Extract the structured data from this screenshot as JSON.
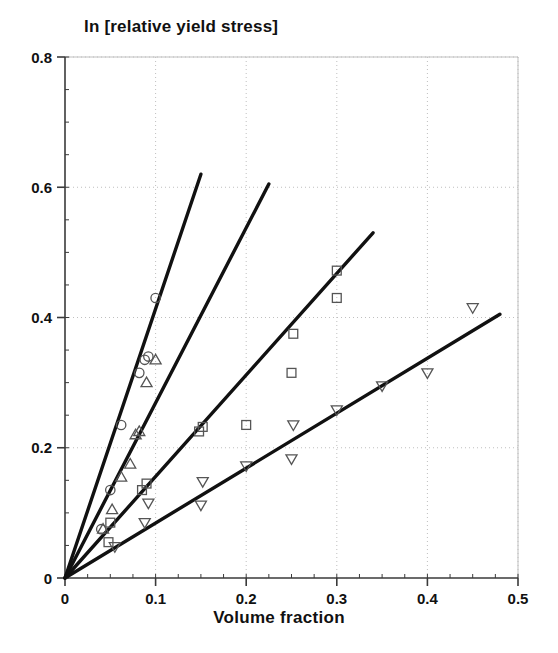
{
  "chart_data": {
    "type": "scatter",
    "title": "ln [relative yield stress]",
    "xlabel": "Volume fraction",
    "ylabel": "",
    "xlim": [
      0,
      0.5
    ],
    "ylim": [
      0,
      0.8
    ],
    "xticks": [
      0,
      0.1,
      0.2,
      0.3,
      0.4,
      0.5
    ],
    "xtick_labels": [
      "0",
      "0.1",
      "0.2",
      "0.3",
      "0.4",
      "0.5"
    ],
    "yticks": [
      0,
      0.2,
      0.4,
      0.6,
      0.8
    ],
    "ytick_labels": [
      "0",
      "0.2",
      "0.4",
      "0.6",
      "0.8"
    ],
    "minor_tick_step_x": 0.025,
    "minor_tick_step_y": 0.05,
    "grid": "major-dotted",
    "legend": "none",
    "series": [
      {
        "name": "circles",
        "marker": "circle",
        "points": [
          [
            0.0,
            0.0
          ],
          [
            0.04,
            0.075
          ],
          [
            0.05,
            0.135
          ],
          [
            0.062,
            0.235
          ],
          [
            0.082,
            0.315
          ],
          [
            0.088,
            0.335
          ],
          [
            0.092,
            0.34
          ],
          [
            0.1,
            0.43
          ]
        ],
        "fit_line": {
          "slope": 4.13,
          "intercept": 0.0,
          "x_start": 0.0,
          "x_end": 0.15,
          "y_start": 0.0,
          "y_end": 0.62
        }
      },
      {
        "name": "triangles-up",
        "marker": "triangle-up",
        "points": [
          [
            0.0,
            0.0
          ],
          [
            0.042,
            0.075
          ],
          [
            0.052,
            0.105
          ],
          [
            0.062,
            0.155
          ],
          [
            0.072,
            0.175
          ],
          [
            0.078,
            0.22
          ],
          [
            0.082,
            0.225
          ],
          [
            0.09,
            0.3
          ],
          [
            0.1,
            0.335
          ]
        ],
        "fit_line": {
          "slope": 2.69,
          "intercept": 0.0,
          "x_start": 0.0,
          "x_end": 0.225,
          "y_start": 0.0,
          "y_end": 0.605
        }
      },
      {
        "name": "squares",
        "marker": "square",
        "points": [
          [
            0.0,
            0.0
          ],
          [
            0.048,
            0.055
          ],
          [
            0.05,
            0.085
          ],
          [
            0.085,
            0.135
          ],
          [
            0.09,
            0.145
          ],
          [
            0.148,
            0.225
          ],
          [
            0.152,
            0.232
          ],
          [
            0.2,
            0.235
          ],
          [
            0.25,
            0.315
          ],
          [
            0.252,
            0.375
          ],
          [
            0.3,
            0.43
          ],
          [
            0.3,
            0.472
          ]
        ],
        "fit_line": {
          "slope": 1.56,
          "intercept": 0.0,
          "x_start": 0.0,
          "x_end": 0.34,
          "y_start": 0.0,
          "y_end": 0.53
        }
      },
      {
        "name": "triangles-down",
        "marker": "triangle-down",
        "points": [
          [
            0.0,
            0.0
          ],
          [
            0.055,
            0.048
          ],
          [
            0.088,
            0.085
          ],
          [
            0.092,
            0.115
          ],
          [
            0.15,
            0.112
          ],
          [
            0.152,
            0.148
          ],
          [
            0.2,
            0.172
          ],
          [
            0.25,
            0.183
          ],
          [
            0.252,
            0.235
          ],
          [
            0.3,
            0.258
          ],
          [
            0.35,
            0.295
          ],
          [
            0.4,
            0.315
          ],
          [
            0.45,
            0.415
          ]
        ],
        "fit_line": {
          "slope": 0.845,
          "intercept": 0.0,
          "x_start": 0.0,
          "x_end": 0.48,
          "y_start": 0.0,
          "y_end": 0.405
        }
      }
    ]
  },
  "colors": {
    "axis": "#3a3a3a",
    "grid": "#bfbfbf",
    "line": "#111111",
    "marker": "#555555",
    "text": "#111111",
    "background": "#ffffff"
  }
}
